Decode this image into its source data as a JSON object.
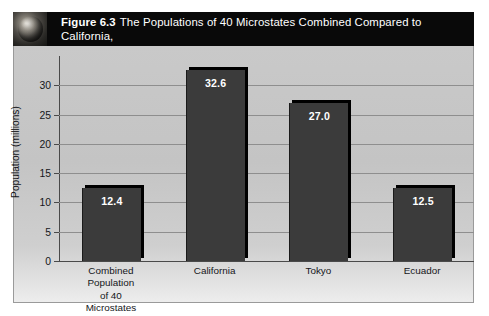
{
  "figure": {
    "icon_name": "globe-icon",
    "number_label": "Figure 6.3",
    "title_line1": "The Populations of 40 Microstates Combined Compared to California,",
    "title_line2": "Tokyo,  and Ecuador",
    "header_bg": "#090909",
    "header_text_color": "#ffffff",
    "panel_bg": "#c7c7c7"
  },
  "chart_data": {
    "type": "bar",
    "categories": [
      "Combined\nPopulation\nof 40\nMicrostates",
      "California",
      "Tokyo",
      "Ecuador"
    ],
    "category_lines": [
      [
        "Combined",
        "Population",
        "of 40",
        "Microstates"
      ],
      [
        "California"
      ],
      [
        "Tokyo"
      ],
      [
        "Ecuador"
      ]
    ],
    "values": [
      12.4,
      32.6,
      27.0,
      12.5
    ],
    "value_labels": [
      "12.4",
      "32.6",
      "27.0",
      "12.5"
    ],
    "xlabel": "",
    "ylabel": "Population (millions)",
    "ylim": [
      0,
      35
    ],
    "yticks": [
      0,
      5,
      10,
      15,
      20,
      25,
      30
    ],
    "ytick_labels": [
      "0",
      "5",
      "10",
      "15",
      "20",
      "25",
      "30"
    ],
    "grid": true,
    "legend": false,
    "bar_color": "#3b3b3b",
    "bar_shadow_color": "#000000",
    "value_label_color": "#ffffff",
    "gridline_color": "#8e8e8e",
    "axis_color": "#4a4a4a"
  }
}
